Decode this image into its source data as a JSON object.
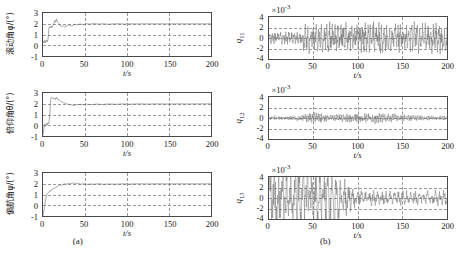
{
  "figure": {
    "panel_a_caption": "(a)",
    "panel_b_caption": "(b)",
    "xlabel": "t/s"
  },
  "chart_data": [
    {
      "id": "roll",
      "panel": "a",
      "position": "top-left",
      "type": "line",
      "title": "",
      "ylabel": "滚动角φ/(°)",
      "ylabel_quantity": "滚动角",
      "ylabel_symbol": "φ",
      "ylabel_unit": "(°)",
      "xlabel": "t/s",
      "xlim": [
        0,
        200
      ],
      "ylim": [
        -1,
        3
      ],
      "xticks": [
        0,
        50,
        100,
        150,
        200
      ],
      "yticks": [
        -1,
        0,
        1,
        2,
        3
      ],
      "grid": true,
      "exponent": "",
      "series": [
        {
          "name": "phi",
          "description": "Roll angle step response settling to 2 degrees",
          "x": [
            0,
            1,
            2,
            3,
            4,
            5,
            6,
            7,
            8,
            9,
            10,
            11,
            12,
            13,
            14,
            15,
            16,
            17,
            18,
            19,
            20,
            22,
            24,
            26,
            28,
            30,
            32,
            34,
            36,
            38,
            40,
            44,
            48,
            52,
            56,
            60,
            66,
            72,
            78,
            84,
            90,
            96,
            104,
            112,
            120,
            130,
            140,
            150,
            160,
            170,
            180,
            190,
            200
          ],
          "y": [
            0.4,
            0.2,
            0.45,
            0.25,
            0.5,
            0.3,
            0.55,
            1.6,
            1.75,
            1.6,
            1.8,
            1.65,
            1.85,
            2.0,
            2.3,
            2.15,
            2.45,
            2.25,
            2.1,
            2.0,
            1.85,
            1.75,
            1.8,
            1.7,
            1.78,
            1.85,
            1.9,
            1.8,
            1.88,
            1.95,
            1.9,
            1.98,
            1.92,
            2.0,
            1.96,
            2.02,
            1.97,
            2.0,
            1.95,
            1.99,
            2.0,
            1.97,
            2.0,
            1.98,
            2.0,
            1.99,
            2.0,
            1.98,
            2.0,
            1.99,
            2.0,
            1.99,
            2.0
          ]
        }
      ]
    },
    {
      "id": "pitch",
      "panel": "a",
      "position": "middle-left",
      "type": "line",
      "title": "",
      "ylabel": "俯仰角θ/(°)",
      "ylabel_quantity": "俯仰角",
      "ylabel_symbol": "θ",
      "ylabel_unit": "(°)",
      "xlabel": "t/s",
      "xlim": [
        0,
        200
      ],
      "ylim": [
        -1,
        3
      ],
      "xticks": [
        0,
        50,
        100,
        150,
        200
      ],
      "yticks": [
        -1,
        0,
        1,
        2,
        3
      ],
      "grid": true,
      "exponent": "",
      "series": [
        {
          "name": "theta",
          "description": "Pitch angle rising from -1 to steady 2 degrees",
          "x": [
            0,
            1,
            2,
            3,
            4,
            5,
            6,
            7,
            8,
            9,
            10,
            11,
            12,
            13,
            14,
            15,
            16,
            17,
            18,
            19,
            20,
            22,
            24,
            26,
            28,
            30,
            33,
            36,
            40,
            44,
            48,
            52,
            58,
            64,
            70,
            78,
            86,
            94,
            104,
            114,
            124,
            136,
            148,
            160,
            172,
            184,
            196,
            200
          ],
          "y": [
            -0.9,
            -0.3,
            0.1,
            -0.1,
            0.2,
            0.0,
            0.25,
            0.15,
            0.9,
            2.3,
            2.6,
            2.55,
            2.5,
            2.45,
            2.55,
            2.4,
            2.6,
            2.45,
            2.35,
            2.4,
            2.3,
            2.2,
            2.1,
            2.05,
            2.0,
            1.95,
            1.9,
            1.85,
            1.9,
            1.95,
            1.9,
            1.95,
            1.92,
            1.97,
            1.93,
            1.98,
            1.95,
            1.98,
            1.96,
            1.99,
            1.97,
            1.99,
            1.97,
            1.99,
            1.98,
            1.99,
            1.99,
            2.0
          ]
        }
      ]
    },
    {
      "id": "yaw",
      "panel": "a",
      "position": "bottom-left",
      "type": "line",
      "title": "",
      "ylabel": "偏航角ψ/(°)",
      "ylabel_quantity": "偏航角",
      "ylabel_symbol": "ψ",
      "ylabel_unit": "(°)",
      "xlabel": "t/s",
      "xlim": [
        0,
        200
      ],
      "ylim": [
        -1,
        3
      ],
      "xticks": [
        0,
        50,
        100,
        150,
        200
      ],
      "yticks": [
        -1,
        0,
        1,
        2,
        3
      ],
      "grid": true,
      "exponent": "",
      "series": [
        {
          "name": "psi",
          "description": "Yaw angle rising from -1 to steady 2 degrees",
          "x": [
            0,
            1,
            2,
            3,
            4,
            5,
            6,
            7,
            8,
            9,
            10,
            12,
            14,
            16,
            18,
            20,
            22,
            24,
            26,
            28,
            30,
            33,
            36,
            39,
            42,
            45,
            48,
            52,
            56,
            60,
            66,
            72,
            78,
            86,
            94,
            104,
            114,
            126,
            138,
            150,
            164,
            178,
            192,
            200
          ],
          "y": [
            -1.0,
            -0.6,
            -0.1,
            0.5,
            0.85,
            1.05,
            1.15,
            1.2,
            1.35,
            1.3,
            1.45,
            1.55,
            1.6,
            1.7,
            1.78,
            1.9,
            1.85,
            1.95,
            2.0,
            1.95,
            2.05,
            2.0,
            2.08,
            2.0,
            2.05,
            1.95,
            2.0,
            1.93,
            1.98,
            1.95,
            2.0,
            1.95,
            1.98,
            1.96,
            1.99,
            1.97,
            2.0,
            1.98,
            2.0,
            1.98,
            2.0,
            1.99,
            2.0,
            2.0
          ]
        }
      ]
    },
    {
      "id": "q11",
      "panel": "b",
      "position": "top-right",
      "type": "line",
      "title": "",
      "ylabel": "q11",
      "ylabel_symbol": "q",
      "ylabel_subscript": "11",
      "xlabel": "t/s",
      "xlim": [
        0,
        200
      ],
      "ylim": [
        -4,
        4
      ],
      "xticks": [
        0,
        50,
        100,
        150,
        200
      ],
      "yticks": [
        -4,
        -2,
        0,
        2,
        4
      ],
      "grid": true,
      "exponent": "×10⁻³",
      "exponent_mantissa": "×10",
      "exponent_power": "-3",
      "series": [
        {
          "name": "q11",
          "description": "High-frequency oscillation, amplitude ~1e-3 before t=38s then growing to ~2.5e-3 with occasional spikes to 3.5e-3",
          "envelope_before_t38": 1.0,
          "envelope_after_t38": 2.5,
          "peak_max": 3.6,
          "peak_min": -3.6
        }
      ]
    },
    {
      "id": "q12",
      "panel": "b",
      "position": "middle-right",
      "type": "line",
      "title": "",
      "ylabel": "q12",
      "ylabel_symbol": "q",
      "ylabel_subscript": "12",
      "xlabel": "t/s",
      "xlim": [
        0,
        200
      ],
      "ylim": [
        -4,
        4
      ],
      "xticks": [
        0,
        50,
        100,
        150,
        200
      ],
      "yticks": [
        -4,
        -2,
        0,
        2,
        4
      ],
      "grid": true,
      "exponent": "×10⁻³",
      "exponent_mantissa": "×10",
      "exponent_power": "-3",
      "series": [
        {
          "name": "q12",
          "description": "Low amplitude noise near zero, ~0.3e-3 baseline with bursts to ~0.8e-3 around t=50 and t=95-130",
          "envelope_baseline": 0.35,
          "burst_amplitude": 0.9,
          "burst_centers": [
            50,
            112
          ]
        }
      ]
    },
    {
      "id": "q13",
      "panel": "b",
      "position": "bottom-right",
      "type": "line",
      "title": "",
      "ylabel": "q13",
      "ylabel_symbol": "q",
      "ylabel_subscript": "13",
      "xlabel": "t/s",
      "xlim": [
        0,
        200
      ],
      "ylim": [
        -4,
        4
      ],
      "xticks": [
        0,
        50,
        100,
        150,
        200
      ],
      "yticks": [
        -4,
        -2,
        0,
        2,
        4
      ],
      "grid": true,
      "exponent": "×10⁻³",
      "exponent_mantissa": "×10",
      "exponent_power": "-3",
      "series": [
        {
          "name": "q13",
          "description": "Large saturating noise clipping at +/-4e-3 for t<70s, decaying to ~1.2e-3 amplitude after t=90s",
          "envelope_early": 4.0,
          "envelope_late": 1.3,
          "transition_t": 80
        }
      ]
    }
  ],
  "ticks": {
    "x": [
      "0",
      "50",
      "100",
      "150",
      "200"
    ],
    "y_angle": [
      "3",
      "2",
      "1",
      "0",
      "-1"
    ],
    "y_q": [
      "4",
      "2",
      "0",
      "-2",
      "-4"
    ]
  }
}
